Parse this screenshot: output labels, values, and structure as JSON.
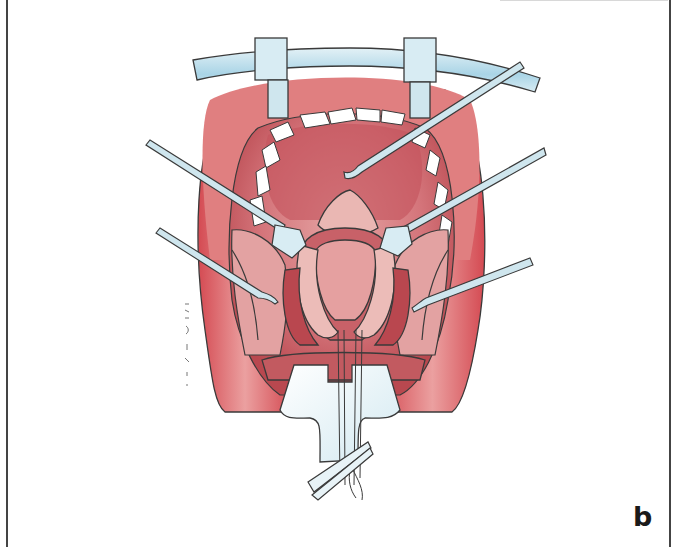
{
  "figure": {
    "panel_label": "b",
    "elements": [
      "mouth-gag-frame",
      "tongue-depressor-blade",
      "upper-dental-arch",
      "lips",
      "palatal-flaps",
      "upper-hook-retractor",
      "left-blunt-retractor",
      "right-blunt-retractor",
      "left-lower-hook",
      "right-lower-hook",
      "sutures-with-forceps"
    ],
    "artist_signature": "illegible vertical signature"
  },
  "colors": {
    "tissue_light": "#e9a7a3",
    "tissue_mid": "#d96f6e",
    "tissue_dark": "#b8404a",
    "lip": "#d8585c",
    "instrument": "#cfe6ee",
    "instrument_accent": "#a9d4e6",
    "outline": "#3a3a3a",
    "teeth": "#ffffff",
    "border": "#444444"
  }
}
